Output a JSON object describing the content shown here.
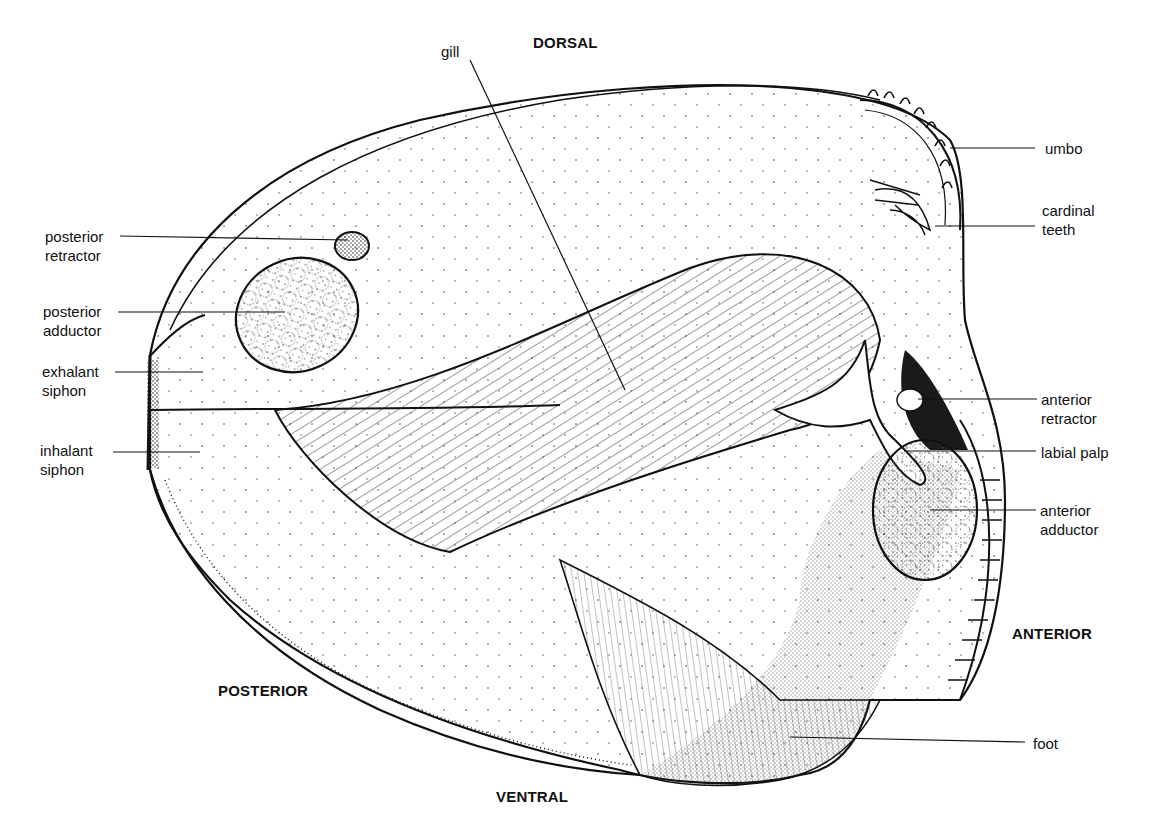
{
  "diagram": {
    "orientation": {
      "dorsal": "DORSAL",
      "ventral": "VENTRAL",
      "anterior": "ANTERIOR",
      "posterior": "POSTERIOR"
    },
    "labels": {
      "gill": "gill",
      "umbo": "umbo",
      "cardinal_teeth": "cardinal\nteeth",
      "posterior_retractor": "posterior\nretractor",
      "posterior_adductor": "posterior\nadductor",
      "exhalant_siphon": "exhalant\nsiphon",
      "inhalant_siphon": "inhalant\nsiphon",
      "anterior_retractor": "anterior\nretractor",
      "labial_palp": "labial palp",
      "anterior_adductor": "anterior\nadductor",
      "foot": "foot"
    },
    "colors": {
      "ink": "#111111",
      "paper": "#ffffff",
      "dark_tissue": "#1a1a1a"
    }
  }
}
